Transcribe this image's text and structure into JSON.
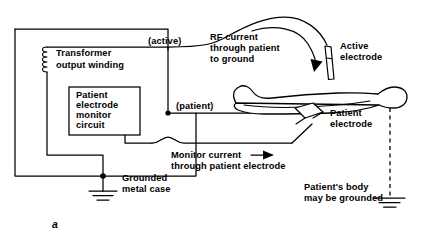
{
  "figure": {
    "label": "a",
    "caption_labels": {
      "transformer": "Transformer\noutput winding",
      "monitor_circuit": "Patient\nelectrode\nmonitor\ncircuit"
    }
  },
  "labels": {
    "transformer_line1": "Transformer",
    "transformer_line2": "output winding",
    "monitor_circuit_line1": "Patient",
    "monitor_circuit_line2": "electrode",
    "monitor_circuit_line3": "monitor",
    "monitor_circuit_line4": "circuit",
    "active_lead": "(active)",
    "patient_lead": "(patient)",
    "rf_current_line1": "RF current",
    "rf_current_line2": "through patient",
    "rf_current_line3": "to ground",
    "active_electrode_line1": "Active",
    "active_electrode_line2": "electrode",
    "patient_electrode_line1": "Patient",
    "patient_electrode_line2": "electrode",
    "monitor_current_line1": "Monitor current",
    "monitor_current_line2": "through patient electrode",
    "grounded_case_line1": "Grounded",
    "grounded_case_line2": "metal case",
    "patient_ground_line1": "Patient's body",
    "patient_ground_line2": "may be grounded",
    "figure_letter": "a"
  },
  "colors": {
    "ink": "#000000",
    "paper": "#ffffff"
  }
}
